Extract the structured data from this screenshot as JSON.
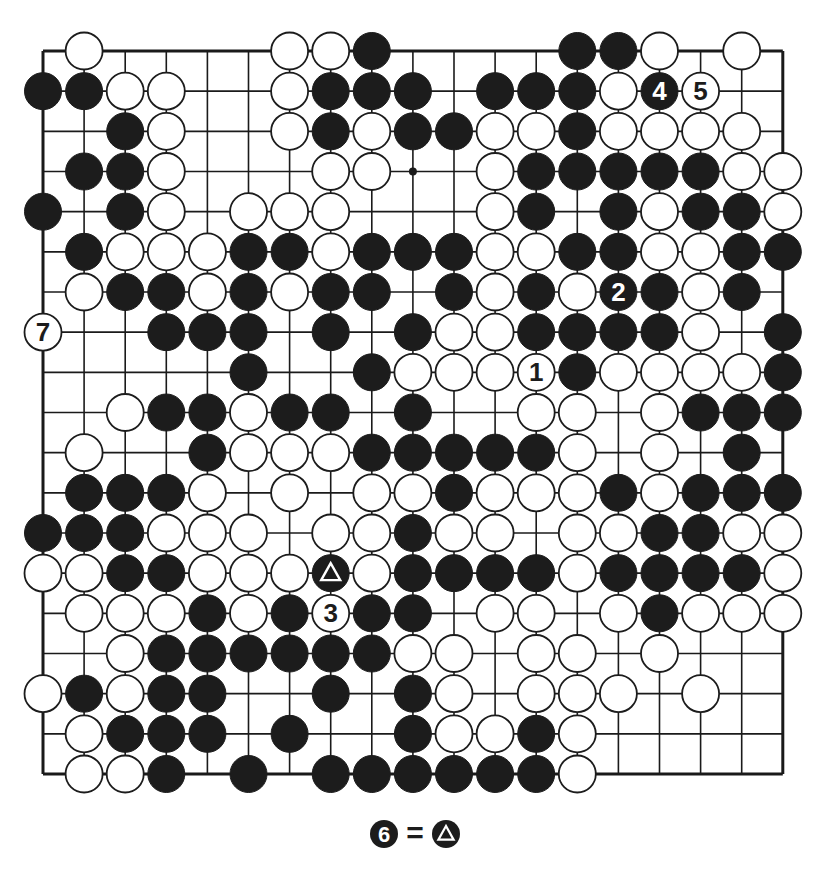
{
  "diagram": {
    "type": "go-board",
    "size": 19,
    "legend": "B = black stone, W = white stone, . = empty; rows listed top to bottom, columns left to right",
    "rows": [
      ".W....WWB....BBW.W.",
      "BBWW..WBBB.BBBWBW..",
      "..BW..WBWBBWWBWWWW.",
      ".BBW...WW..WBBBBBWW",
      "B.BW.WWW...WB.BWBBW",
      ".BWWWBBWBBBWWBBWWBB",
      ".WBBWBWBB.BWBWBBWB.",
      "W..BBB.B.BWWBBBBW.B",
      ".....B..BWWWWBWWWWB",
      "..WBBWBB.B..WW.WBBB",
      ".W..BWWWBBBBBW.W.B.",
      ".BBBW.W.WWBWWWBWBBB",
      "BBBWWW.WWBWW.WWBBWW",
      "WWBBWWWBWBBBBWBBBBW",
      ".WWWBWBWBB.WW.WBWWW",
      "..WBBBBBBWW.WW.W...",
      "WBWBB..B.BW.WWW.W..",
      ".WBBB.B..BWWBW.....",
      ".WWB.B.BBBBBBW....."
    ],
    "numbered_moves": [
      {
        "number": "1",
        "color": "white",
        "row": 9,
        "col": 13
      },
      {
        "number": "2",
        "color": "black",
        "row": 7,
        "col": 15
      },
      {
        "number": "3",
        "color": "white",
        "row": 15,
        "col": 8
      },
      {
        "number": "4",
        "color": "black",
        "row": 2,
        "col": 16
      },
      {
        "number": "5",
        "color": "white",
        "row": 2,
        "col": 17
      },
      {
        "number": "7",
        "color": "white",
        "row": 8,
        "col": 1
      }
    ],
    "marked_stones": [
      {
        "mark": "triangle",
        "color": "black",
        "row": 14,
        "col": 8
      }
    ],
    "star_points": [
      {
        "row": 4,
        "col": 10
      }
    ],
    "caption": {
      "move_number": "6",
      "move_color": "black",
      "equals": "=",
      "target_mark": "triangle"
    }
  }
}
